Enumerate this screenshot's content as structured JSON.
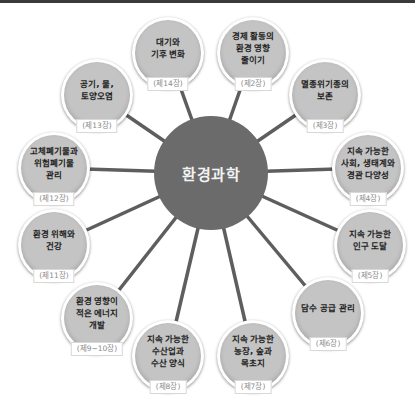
{
  "diagram": {
    "center": {
      "label": "환경과학",
      "x": 211,
      "y": 173,
      "r": 57,
      "color": "#6b6b6b"
    },
    "colors": {
      "node_fill": "#c4c4c4",
      "node_ring": "#ffffff",
      "line": "#5e5e5e",
      "tag_text": "#8a8a8a"
    },
    "nodes": [
      {
        "title": "대기와\n기후 변화",
        "chapter": "(제14장)",
        "x": 168,
        "y": 53
      },
      {
        "title": "경제 활동의\n환경 영향\n줄이기",
        "chapter": "(제2장)",
        "x": 253,
        "y": 53
      },
      {
        "title": "멸종위기종의\n보존",
        "chapter": "(제3장)",
        "x": 325,
        "y": 95
      },
      {
        "title": "지속 가능한\n사회, 생태계와\n경관 다양성",
        "chapter": "(제4장)",
        "x": 368,
        "y": 168
      },
      {
        "title": "지속 가능한\n인구 도달",
        "chapter": "(제5장)",
        "x": 370,
        "y": 245
      },
      {
        "title": "담수 공급 관리",
        "chapter": "(제6장)",
        "x": 328,
        "y": 313
      },
      {
        "title": "지속 가능한\n농장, 숲과\n목초지",
        "chapter": "(제7장)",
        "x": 253,
        "y": 356
      },
      {
        "title": "지속 가능한\n수산업과\n수산 양식",
        "chapter": "(제8장)",
        "x": 168,
        "y": 356
      },
      {
        "title": "환경 영향이\n적은 에너지\n개발",
        "chapter": "(제9~10장)",
        "x": 97,
        "y": 318
      },
      {
        "title": "환경 위해와\n건강",
        "chapter": "(제11장)",
        "x": 54,
        "y": 245
      },
      {
        "title": "고체폐기물과\n위험폐기물\n관리",
        "chapter": "(제12장)",
        "x": 54,
        "y": 168
      },
      {
        "title": "공기, 물,\n토양오염",
        "chapter": "(제13장)",
        "x": 97,
        "y": 95
      }
    ]
  }
}
